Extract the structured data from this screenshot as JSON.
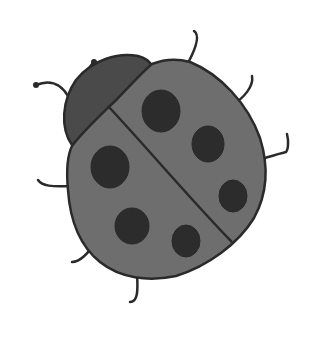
{
  "image": {
    "subject": "ladybug illustration",
    "style": "grayscale hand-drawn clipart",
    "colors": {
      "background": "#ffffff",
      "outline": "#2a2a2a",
      "head": "#4a4a4a",
      "shell": "#6e6e6e",
      "spots": "#2c2c2c"
    },
    "spot_count": 6,
    "leg_count": 6,
    "antenna_count": 2
  }
}
